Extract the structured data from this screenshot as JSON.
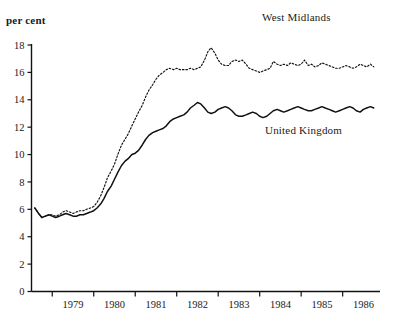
{
  "figure": {
    "title_partial": "",
    "unit_label": "per cent"
  },
  "chart_data": {
    "type": "line",
    "title": "",
    "xlabel": "",
    "ylabel": "per cent",
    "ylim": [
      0,
      18
    ],
    "yticks": [
      0,
      2,
      4,
      6,
      8,
      10,
      12,
      14,
      16,
      18
    ],
    "xticks_labels": [
      "1979",
      "1980",
      "1981",
      "1982",
      "1983",
      "1984",
      "1985",
      "1986"
    ],
    "xlim": [
      1978.5,
      1986.9
    ],
    "grid": false,
    "legend_position": "inline-annotations",
    "annotations": [
      {
        "text": "West Midlands",
        "series": "West Midlands",
        "x": 1985.2,
        "y": 18.6
      },
      {
        "text": "United Kingdom",
        "series": "United Kingdom",
        "x": 1984.4,
        "y": 11.5
      }
    ],
    "x": [
      1978.58,
      1978.67,
      1978.75,
      1978.83,
      1978.92,
      1979.0,
      1979.08,
      1979.17,
      1979.25,
      1979.33,
      1979.42,
      1979.5,
      1979.58,
      1979.67,
      1979.75,
      1979.83,
      1979.92,
      1980.0,
      1980.08,
      1980.17,
      1980.25,
      1980.33,
      1980.42,
      1980.5,
      1980.58,
      1980.67,
      1980.75,
      1980.83,
      1980.92,
      1981.0,
      1981.08,
      1981.17,
      1981.25,
      1981.33,
      1981.42,
      1981.5,
      1981.58,
      1981.67,
      1981.75,
      1981.83,
      1981.92,
      1982.0,
      1982.08,
      1982.17,
      1982.25,
      1982.33,
      1982.42,
      1982.5,
      1982.58,
      1982.67,
      1982.75,
      1982.83,
      1982.92,
      1983.0,
      1983.08,
      1983.17,
      1983.25,
      1983.33,
      1983.42,
      1983.5,
      1983.58,
      1983.67,
      1983.75,
      1983.83,
      1983.92,
      1984.0,
      1984.08,
      1984.17,
      1984.25,
      1984.33,
      1984.42,
      1984.5,
      1984.58,
      1984.67,
      1984.75,
      1984.83,
      1984.92,
      1985.0,
      1985.08,
      1985.17,
      1985.25,
      1985.33,
      1985.42,
      1985.5,
      1985.58,
      1985.67,
      1985.75,
      1985.83,
      1985.92,
      1986.0,
      1986.08,
      1986.17,
      1986.25,
      1986.33,
      1986.42,
      1986.5,
      1986.58,
      1986.67,
      1986.75
    ],
    "series": [
      {
        "name": "West Midlands",
        "style": "dotted",
        "color": "#111111",
        "values": [
          6.1,
          5.7,
          5.4,
          5.5,
          5.6,
          5.6,
          5.5,
          5.6,
          5.8,
          5.9,
          5.8,
          5.7,
          5.8,
          5.9,
          5.9,
          6.0,
          6.1,
          6.2,
          6.5,
          7.0,
          7.6,
          8.3,
          8.8,
          9.3,
          10.0,
          10.7,
          11.1,
          11.5,
          12.1,
          12.6,
          13.1,
          13.6,
          14.2,
          14.7,
          15.1,
          15.5,
          15.8,
          16.0,
          16.2,
          16.3,
          16.2,
          16.3,
          16.2,
          16.2,
          16.2,
          16.3,
          16.2,
          16.3,
          16.4,
          16.9,
          17.5,
          17.8,
          17.4,
          16.9,
          16.6,
          16.5,
          16.5,
          16.8,
          16.9,
          16.8,
          16.9,
          16.6,
          16.3,
          16.2,
          16.1,
          16.0,
          16.1,
          16.2,
          16.3,
          16.8,
          16.6,
          16.5,
          16.6,
          16.5,
          16.7,
          16.6,
          16.5,
          16.6,
          16.9,
          16.5,
          16.6,
          16.4,
          16.5,
          16.7,
          16.6,
          16.5,
          16.4,
          16.3,
          16.3,
          16.4,
          16.5,
          16.4,
          16.3,
          16.4,
          16.6,
          16.5,
          16.4,
          16.6,
          16.4
        ]
      },
      {
        "name": "United Kingdom",
        "style": "solid",
        "color": "#111111",
        "values": [
          6.1,
          5.7,
          5.4,
          5.5,
          5.6,
          5.5,
          5.4,
          5.5,
          5.6,
          5.7,
          5.6,
          5.5,
          5.5,
          5.6,
          5.6,
          5.7,
          5.8,
          5.9,
          6.1,
          6.4,
          6.8,
          7.3,
          7.7,
          8.2,
          8.7,
          9.2,
          9.5,
          9.7,
          10.0,
          10.1,
          10.3,
          10.7,
          11.1,
          11.4,
          11.6,
          11.7,
          11.8,
          11.9,
          12.1,
          12.4,
          12.6,
          12.7,
          12.8,
          12.9,
          13.1,
          13.4,
          13.6,
          13.8,
          13.7,
          13.4,
          13.1,
          13.0,
          13.1,
          13.3,
          13.4,
          13.5,
          13.4,
          13.2,
          12.9,
          12.8,
          12.8,
          12.9,
          13.0,
          13.1,
          13.0,
          12.8,
          12.7,
          12.8,
          13.0,
          13.2,
          13.3,
          13.2,
          13.1,
          13.2,
          13.3,
          13.4,
          13.5,
          13.4,
          13.3,
          13.2,
          13.2,
          13.3,
          13.4,
          13.5,
          13.4,
          13.3,
          13.2,
          13.1,
          13.2,
          13.3,
          13.4,
          13.5,
          13.4,
          13.2,
          13.1,
          13.3,
          13.4,
          13.5,
          13.4
        ]
      }
    ]
  }
}
